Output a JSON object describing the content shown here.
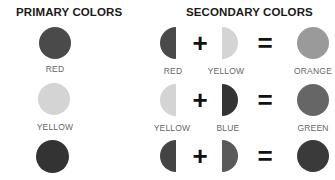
{
  "primary": {
    "title": "PRIMARY COLORS",
    "items": [
      {
        "label": "RED",
        "color": "#4a4a4a"
      },
      {
        "label": "YELLOW",
        "color": "#d4d4d4"
      },
      {
        "label": "",
        "color": "#333333"
      }
    ]
  },
  "secondary": {
    "title": "SECONDARY COLORS",
    "plus": "+",
    "equals": "=",
    "rows": [
      {
        "left": {
          "label": "RED",
          "color": "#4a4a4a"
        },
        "right": {
          "label": "YELLOW",
          "color": "#d4d4d4"
        },
        "result": {
          "label": "ORANGE",
          "color": "#9a9a9a"
        }
      },
      {
        "left": {
          "label": "YELLOW",
          "color": "#d4d4d4"
        },
        "right": {
          "label": "BLUE",
          "color": "#333333"
        },
        "result": {
          "label": "GREEN",
          "color": "#666666"
        }
      },
      {
        "left": {
          "label": "",
          "color": "#444444"
        },
        "right": {
          "label": "",
          "color": "#5a5a5a"
        },
        "result": {
          "label": "",
          "color": "#3a3a3a"
        }
      }
    ]
  }
}
